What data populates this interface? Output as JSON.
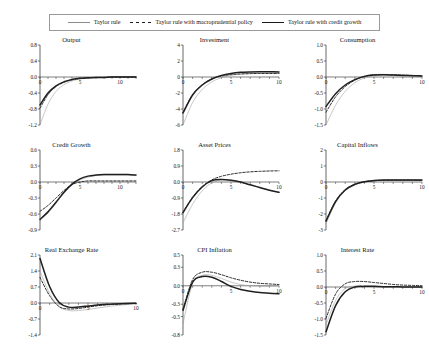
{
  "figure": {
    "legend": {
      "position": "top-center",
      "items": [
        {
          "label": "Taylor rule",
          "style": "thin-solid-gray",
          "color": "#8d8d8d"
        },
        {
          "label": "Taylor rule with macroprudential policy",
          "style": "dashed-black",
          "color": "#1a1a1a"
        },
        {
          "label": "Taylor rule with credit growth",
          "style": "thick-solid-black",
          "color": "#1a1a1a"
        }
      ]
    },
    "layout": {
      "rows": 3,
      "cols": 3
    }
  },
  "chart_data": [
    {
      "type": "line",
      "title": "Output",
      "xlabel": "",
      "ylabel": "",
      "x": [
        0,
        1,
        2,
        3,
        4,
        5,
        6,
        7,
        8,
        9,
        10,
        11,
        12
      ],
      "xlim": [
        0,
        12
      ],
      "xticks": [
        0,
        5,
        10
      ],
      "ylim": [
        -1.2,
        0.8
      ],
      "yticks": [
        0.8,
        0.4,
        0.0,
        -0.4,
        -0.8,
        -1.2
      ],
      "ytick_labels": [
        "0.8",
        "0.4",
        "0.0",
        "-0.4",
        "-0.8",
        "-1.2"
      ],
      "grid": false,
      "series": [
        {
          "name": "Taylor rule",
          "values": [
            -1.2,
            -0.68,
            -0.36,
            -0.19,
            -0.1,
            -0.05,
            -0.03,
            -0.02,
            -0.01,
            -0.01,
            0.0,
            0.0,
            0.0
          ]
        },
        {
          "name": "Taylor rule with macroprudential policy",
          "values": [
            -0.78,
            -0.44,
            -0.24,
            -0.13,
            -0.07,
            -0.04,
            -0.02,
            -0.01,
            -0.01,
            0.0,
            0.0,
            0.0,
            0.0
          ]
        },
        {
          "name": "Taylor rule with credit growth",
          "values": [
            -0.7,
            -0.4,
            -0.22,
            -0.12,
            -0.06,
            -0.03,
            -0.02,
            -0.01,
            -0.01,
            0.0,
            0.0,
            0.0,
            0.0
          ]
        }
      ]
    },
    {
      "type": "line",
      "title": "Investment",
      "xlabel": "",
      "ylabel": "",
      "x": [
        0,
        1,
        2,
        3,
        4,
        5,
        6,
        7,
        8,
        9,
        10
      ],
      "xlim": [
        0,
        10
      ],
      "xticks": [
        0,
        5,
        10
      ],
      "ylim": [
        -6,
        4
      ],
      "yticks": [
        4,
        2,
        0,
        -2,
        -4,
        -6
      ],
      "ytick_labels": [
        "4",
        "2",
        "0",
        "-2",
        "-4",
        "-6"
      ],
      "grid": false,
      "series": [
        {
          "name": "Taylor rule",
          "values": [
            -6.0,
            -3.2,
            -1.55,
            -0.62,
            -0.08,
            0.2,
            0.36,
            0.44,
            0.48,
            0.5,
            0.5
          ]
        },
        {
          "name": "Taylor rule with macroprudential policy",
          "values": [
            -4.45,
            -2.2,
            -0.98,
            -0.26,
            0.12,
            0.3,
            0.38,
            0.42,
            0.44,
            0.44,
            0.44
          ]
        },
        {
          "name": "Taylor rule with credit growth",
          "values": [
            -4.5,
            -2.25,
            -1.0,
            -0.25,
            0.2,
            0.45,
            0.58,
            0.63,
            0.65,
            0.65,
            0.64
          ]
        }
      ]
    },
    {
      "type": "line",
      "title": "Consumption",
      "xlabel": "",
      "ylabel": "",
      "x": [
        0,
        1,
        2,
        3,
        4,
        5,
        6,
        7,
        8,
        9,
        10
      ],
      "xlim": [
        0,
        10
      ],
      "xticks": [
        0,
        5,
        10
      ],
      "ylim": [
        -1.5,
        1.0
      ],
      "yticks": [
        1.0,
        0.5,
        0.0,
        -0.5,
        -1.0,
        -1.5
      ],
      "ytick_labels": [
        "1.0",
        "0.5",
        "0.0",
        "-0.5",
        "-1.0",
        "-1.5"
      ],
      "grid": false,
      "series": [
        {
          "name": "Taylor rule",
          "values": [
            -1.5,
            -0.88,
            -0.45,
            -0.18,
            -0.03,
            0.04,
            0.06,
            0.06,
            0.05,
            0.04,
            0.03
          ]
        },
        {
          "name": "Taylor rule with macroprudential policy",
          "values": [
            -1.1,
            -0.62,
            -0.3,
            -0.1,
            0.02,
            0.07,
            0.08,
            0.07,
            0.06,
            0.05,
            0.04
          ]
        },
        {
          "name": "Taylor rule with credit growth",
          "values": [
            -0.92,
            -0.52,
            -0.25,
            -0.08,
            0.02,
            0.06,
            0.07,
            0.06,
            0.05,
            0.04,
            0.03
          ]
        }
      ]
    },
    {
      "type": "line",
      "title": "Credit Growth",
      "xlabel": "",
      "ylabel": "",
      "x": [
        0,
        1,
        2,
        3,
        4,
        5,
        6,
        7,
        8,
        9,
        10,
        11,
        12
      ],
      "xlim": [
        0,
        12
      ],
      "xticks": [
        0,
        5,
        10
      ],
      "ylim": [
        -0.9,
        0.6
      ],
      "yticks": [
        0.6,
        0.3,
        0.0,
        -0.3,
        -0.6,
        -0.9
      ],
      "ytick_labels": [
        "0.6",
        "0.3",
        "0.0",
        "-0.3",
        "-0.6",
        "-0.9"
      ],
      "grid": false,
      "series": [
        {
          "name": "Taylor rule",
          "values": [
            -0.72,
            -0.58,
            -0.4,
            -0.21,
            -0.06,
            0.04,
            0.09,
            0.12,
            0.13,
            0.13,
            0.13,
            0.13,
            0.12
          ]
        },
        {
          "name": "Taylor rule with macroprudential policy",
          "values": [
            -0.55,
            -0.44,
            -0.3,
            -0.16,
            -0.05,
            0.0,
            0.02,
            0.02,
            0.02,
            0.02,
            0.02,
            0.02,
            0.02
          ]
        },
        {
          "name": "Taylor rule with credit growth",
          "values": [
            -0.7,
            -0.56,
            -0.38,
            -0.19,
            -0.04,
            0.06,
            0.11,
            0.13,
            0.14,
            0.14,
            0.14,
            0.14,
            0.13
          ]
        }
      ]
    },
    {
      "type": "line",
      "title": "Asset Prices",
      "xlabel": "",
      "ylabel": "",
      "x": [
        0,
        1,
        2,
        3,
        4,
        5,
        6,
        7,
        8,
        9,
        10
      ],
      "xlim": [
        0,
        10
      ],
      "xticks": [
        0,
        5,
        10
      ],
      "ylim": [
        -2.7,
        1.8
      ],
      "yticks": [
        1.8,
        0.9,
        0.0,
        -0.9,
        -1.8,
        -2.7
      ],
      "ytick_labels": [
        "1.8",
        "0.9",
        "0.0",
        "-0.9",
        "-1.8",
        "-2.7"
      ],
      "grid": false,
      "series": [
        {
          "name": "Taylor rule",
          "values": [
            -2.3,
            -1.25,
            -0.5,
            -0.05,
            0.12,
            0.1,
            0.0,
            -0.15,
            -0.3,
            -0.45,
            -0.58
          ]
        },
        {
          "name": "Taylor rule with macroprudential policy",
          "values": [
            -1.7,
            -0.85,
            -0.25,
            0.12,
            0.32,
            0.44,
            0.52,
            0.57,
            0.6,
            0.62,
            0.63
          ]
        },
        {
          "name": "Taylor rule with credit growth",
          "values": [
            -1.72,
            -0.88,
            -0.28,
            0.08,
            0.14,
            0.1,
            0.0,
            -0.16,
            -0.31,
            -0.46,
            -0.58
          ]
        }
      ]
    },
    {
      "type": "line",
      "title": "Capital Inflows",
      "xlabel": "",
      "ylabel": "",
      "x": [
        0,
        1,
        2,
        3,
        4,
        5,
        6,
        7,
        8,
        9,
        10
      ],
      "xlim": [
        0,
        10
      ],
      "xticks": [
        0,
        5,
        10
      ],
      "ylim": [
        -3,
        2
      ],
      "yticks": [
        2,
        1,
        0,
        -1,
        -2,
        -3
      ],
      "ytick_labels": [
        "2",
        "1",
        "0",
        "-1",
        "-2",
        "-3"
      ],
      "grid": false,
      "series": [
        {
          "name": "Taylor rule",
          "values": [
            -2.62,
            -1.3,
            -0.55,
            -0.18,
            0.0,
            0.08,
            0.11,
            0.12,
            0.12,
            0.12,
            0.11
          ]
        },
        {
          "name": "Taylor rule with macroprudential policy",
          "values": [
            -2.4,
            -1.18,
            -0.48,
            -0.14,
            0.02,
            0.08,
            0.1,
            0.11,
            0.11,
            0.11,
            0.1
          ]
        },
        {
          "name": "Taylor rule with credit growth",
          "values": [
            -2.45,
            -1.22,
            -0.5,
            -0.15,
            0.02,
            0.09,
            0.12,
            0.13,
            0.13,
            0.13,
            0.12
          ]
        }
      ]
    },
    {
      "type": "line",
      "title": "Real Exchange Rate",
      "xlabel": "",
      "ylabel": "",
      "x": [
        0,
        1,
        2,
        3,
        4,
        5,
        6,
        7,
        8,
        9,
        10
      ],
      "xlim": [
        0,
        10
      ],
      "xticks": [
        0,
        5,
        10
      ],
      "ylim": [
        -1.4,
        2.1
      ],
      "yticks": [
        2.1,
        1.4,
        0.7,
        0.0,
        -0.7,
        -1.4
      ],
      "ytick_labels": [
        "2.1",
        "1.4",
        "0.7",
        "0.0",
        "-0.7",
        "-1.4"
      ],
      "grid": false,
      "series": [
        {
          "name": "Taylor rule",
          "values": [
            1.4,
            0.42,
            -0.16,
            -0.33,
            -0.33,
            -0.28,
            -0.22,
            -0.16,
            -0.11,
            -0.07,
            -0.05
          ]
        },
        {
          "name": "Taylor rule with macroprudential policy",
          "values": [
            1.12,
            0.32,
            -0.16,
            -0.26,
            -0.24,
            -0.18,
            -0.12,
            -0.08,
            -0.05,
            -0.03,
            -0.02
          ]
        },
        {
          "name": "Taylor rule with credit growth",
          "values": [
            1.95,
            0.72,
            0.02,
            -0.18,
            -0.17,
            -0.13,
            -0.09,
            -0.06,
            -0.04,
            -0.02,
            -0.01
          ]
        }
      ]
    },
    {
      "type": "line",
      "title": "CPI Inflation",
      "xlabel": "",
      "ylabel": "",
      "x": [
        0,
        1,
        2,
        3,
        4,
        5,
        6,
        7,
        8,
        9,
        10
      ],
      "xlim": [
        0,
        10
      ],
      "xticks": [
        0,
        5,
        10
      ],
      "ylim": [
        -0.8,
        0.5
      ],
      "yticks": [
        0.5,
        0.3,
        0.0,
        -0.3,
        -0.5,
        -0.8
      ],
      "ytick_labels": [
        "0.5",
        "0.3",
        "0.0",
        "-0.3",
        "-0.5",
        "-0.8"
      ],
      "grid": false,
      "series": [
        {
          "name": "Taylor rule",
          "values": [
            -0.62,
            0.04,
            0.17,
            0.17,
            0.12,
            0.06,
            0.02,
            0.0,
            -0.01,
            -0.01,
            -0.01
          ]
        },
        {
          "name": "Taylor rule with macroprudential policy",
          "values": [
            -0.38,
            0.1,
            0.22,
            0.22,
            0.18,
            0.13,
            0.09,
            0.06,
            0.04,
            0.03,
            0.02
          ]
        },
        {
          "name": "Taylor rule with credit growth",
          "values": [
            -0.4,
            0.06,
            0.15,
            0.14,
            0.07,
            -0.01,
            -0.06,
            -0.09,
            -0.11,
            -0.12,
            -0.13
          ]
        }
      ]
    },
    {
      "type": "line",
      "title": "Interest Rate",
      "xlabel": "",
      "ylabel": "",
      "x": [
        0,
        1,
        2,
        3,
        4,
        5,
        6,
        7,
        8,
        9,
        10
      ],
      "xlim": [
        0,
        10
      ],
      "xticks": [
        0,
        5,
        10
      ],
      "ylim": [
        -1.5,
        1.0
      ],
      "yticks": [
        1.0,
        0.5,
        0.0,
        -0.5,
        -1.0,
        -1.5
      ],
      "ytick_labels": [
        "1.0",
        "0.5",
        "0.0",
        "-0.5",
        "-1.0",
        "-1.5"
      ],
      "grid": false,
      "series": [
        {
          "name": "Taylor rule",
          "values": [
            -1.18,
            -0.42,
            -0.05,
            0.03,
            0.03,
            0.02,
            0.01,
            0.0,
            0.0,
            0.0,
            0.0
          ]
        },
        {
          "name": "Taylor rule with macroprudential policy",
          "values": [
            -0.98,
            -0.22,
            0.1,
            0.17,
            0.17,
            0.14,
            0.11,
            0.08,
            0.06,
            0.05,
            0.04
          ]
        },
        {
          "name": "Taylor rule with credit growth",
          "values": [
            -1.4,
            -0.58,
            -0.15,
            0.0,
            0.02,
            0.02,
            0.01,
            0.01,
            0.0,
            0.0,
            0.0
          ]
        }
      ]
    }
  ]
}
